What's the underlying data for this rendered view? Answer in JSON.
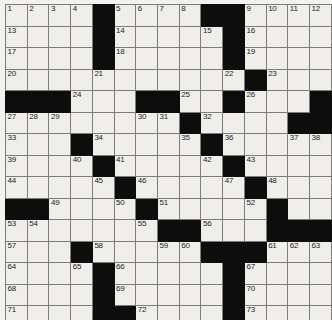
{
  "puzzle": {
    "kind": "crossword-grid",
    "rows": 15,
    "cols": 15,
    "colors": {
      "block": "#0d0d0d",
      "cell": "#efeeea",
      "grid_line": "#7d7d79",
      "border": "#4a4a48",
      "page_background": "#f2f2ee",
      "number_text": "#1c1c1c"
    },
    "layout": {
      "cell_px": 21.4,
      "show_numbers": true,
      "letters_filled": false
    },
    "blocks": [
      [
        0,
        4
      ],
      [
        0,
        9
      ],
      [
        0,
        10
      ],
      [
        1,
        4
      ],
      [
        1,
        10
      ],
      [
        2,
        4
      ],
      [
        2,
        10
      ],
      [
        3,
        11
      ],
      [
        4,
        0
      ],
      [
        4,
        1
      ],
      [
        4,
        2
      ],
      [
        4,
        6
      ],
      [
        4,
        7
      ],
      [
        4,
        10
      ],
      [
        4,
        14
      ],
      [
        5,
        8
      ],
      [
        5,
        13
      ],
      [
        5,
        14
      ],
      [
        6,
        3
      ],
      [
        6,
        9
      ],
      [
        7,
        4
      ],
      [
        7,
        10
      ],
      [
        8,
        5
      ],
      [
        8,
        11
      ],
      [
        9,
        0
      ],
      [
        9,
        1
      ],
      [
        9,
        6
      ],
      [
        9,
        12
      ],
      [
        10,
        7
      ],
      [
        10,
        8
      ],
      [
        10,
        12
      ],
      [
        10,
        13
      ],
      [
        10,
        14
      ],
      [
        11,
        3
      ],
      [
        11,
        9
      ],
      [
        11,
        10
      ],
      [
        11,
        11
      ],
      [
        12,
        4
      ],
      [
        12,
        10
      ],
      [
        13,
        4
      ],
      [
        13,
        10
      ],
      [
        14,
        4
      ],
      [
        14,
        5
      ],
      [
        14,
        10
      ]
    ],
    "numbers": {
      "0,0": "1",
      "0,1": "2",
      "0,2": "3",
      "0,3": "4",
      "0,5": "5",
      "0,6": "6",
      "0,7": "7",
      "0,8": "8",
      "0,11": "9",
      "0,12": "10",
      "0,13": "11",
      "0,14": "12",
      "1,0": "13",
      "1,5": "14",
      "1,9": "15",
      "1,11": "16",
      "2,0": "17",
      "2,5": "18",
      "2,11": "19",
      "3,0": "20",
      "3,4": "21",
      "3,10": "22",
      "3,12": "23",
      "4,3": "24",
      "4,8": "25",
      "4,11": "26",
      "5,0": "27",
      "5,1": "28",
      "5,2": "29",
      "5,6": "30",
      "5,7": "31",
      "5,9": "32",
      "6,0": "33",
      "6,4": "34",
      "6,8": "35",
      "6,10": "36",
      "6,13": "37",
      "6,14": "38",
      "7,0": "39",
      "7,3": "40",
      "7,5": "41",
      "7,9": "42",
      "7,11": "43",
      "8,0": "44",
      "8,4": "45",
      "8,6": "46",
      "8,10": "47",
      "8,12": "48",
      "9,2": "49",
      "9,5": "50",
      "9,7": "51",
      "9,11": "52",
      "10,0": "53",
      "10,1": "54",
      "10,6": "55",
      "10,9": "56",
      "11,0": "57",
      "11,4": "58",
      "11,7": "59",
      "11,8": "60",
      "11,12": "61",
      "11,13": "62",
      "11,14": "63",
      "12,0": "64",
      "12,3": "65",
      "12,5": "66",
      "12,11": "67",
      "13,0": "68",
      "13,5": "69",
      "13,11": "70",
      "14,0": "71",
      "14,6": "72",
      "14,11": "73"
    },
    "max_number": "73"
  }
}
